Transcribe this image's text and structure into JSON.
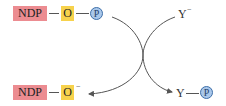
{
  "diagram": {
    "type": "phosphoryl-transfer-reaction",
    "reactant": {
      "ndp_label": "NDP",
      "oxygen_label": "O",
      "phosphate_label": "P"
    },
    "nucleophile": {
      "label": "Y",
      "charge": "−"
    },
    "product_left": {
      "ndp_label": "NDP",
      "oxygen_label": "O",
      "charge": "−"
    },
    "product_right": {
      "label": "Y",
      "phosphate_label": "P"
    },
    "colors": {
      "ndp": "#ec8c91",
      "oxygen": "#f7d24c",
      "phosphate_fill": "#a9c7ea",
      "phosphate_stroke": "#3e6fa9",
      "arrow": "#555555"
    }
  }
}
